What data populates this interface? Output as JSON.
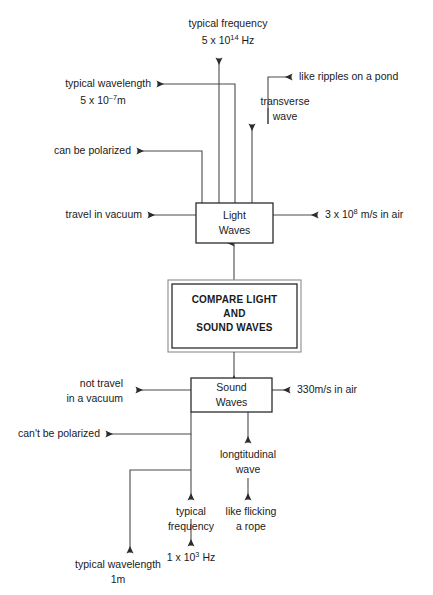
{
  "diagram": {
    "title": "Compare Light and Sound Waves",
    "center_box": {
      "line1": "COMPARE LIGHT",
      "line2": "AND",
      "line3": "SOUND WAVES"
    },
    "light_box": {
      "line1": "Light",
      "line2": "Waves"
    },
    "sound_box": {
      "line1": "Sound",
      "line2": "Waves"
    },
    "light_branches": {
      "frequency_label": "typical frequency",
      "frequency_value_base": "5 x 10",
      "frequency_value_exp": "14",
      "frequency_value_unit": " Hz",
      "wavelength_label": "typical wavelength",
      "wavelength_value_base": "5 x 10",
      "wavelength_value_exp": "–7",
      "wavelength_value_unit": "m",
      "polarized": "can be polarized",
      "vacuum": "travel in vacuum",
      "speed_base": "3 x 10",
      "speed_exp": "8",
      "speed_unit": " m/s in air",
      "wave_type_line1": "transverse",
      "wave_type_line2": "wave",
      "analogy": "like ripples on a pond"
    },
    "sound_branches": {
      "vacuum_line1": "not travel",
      "vacuum_line2": "in a vacuum",
      "polarized": "can't be polarized",
      "speed": "330m/s in air",
      "wave_type_line1": "longtitudinal",
      "wave_type_line2": "wave",
      "analogy_line1": "like flicking",
      "analogy_line2": "a rope",
      "frequency_label_line1": "typical",
      "frequency_label_line2": "frequency",
      "frequency_value_base": "1 x 10",
      "frequency_value_exp": "3",
      "frequency_value_unit": " Hz",
      "wavelength_label": "typical wavelength",
      "wavelength_value": "1m"
    },
    "colors": {
      "line": "#4a4a4a",
      "box_border": "#2b2b2b",
      "outer_border": "#8c8c8c",
      "text": "#1a1a1a",
      "background": "#ffffff"
    }
  }
}
